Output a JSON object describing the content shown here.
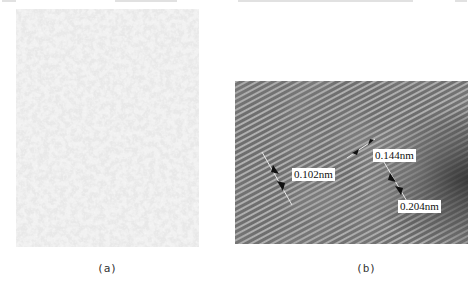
{
  "figure": {
    "panels": [
      {
        "id": "a",
        "caption": "(a)",
        "description": "Low-magnification micrograph with mottled gray/white texture"
      },
      {
        "id": "b",
        "caption": "(b)",
        "description": "High-resolution lattice fringe image with diagonal stripes",
        "annotations": [
          {
            "label": "0.102nm"
          },
          {
            "label": "0.144nm"
          },
          {
            "label": "0.204nm"
          }
        ]
      }
    ],
    "colors": {
      "panel_a_base": "#bdbdbd",
      "panel_a_light": "#f2f2f2",
      "panel_b_base": "#7a7a7a",
      "fringe_light": "#b8b8b8",
      "fringe_dark": "#555555",
      "arrow": "#111111",
      "label_bg": "#ffffff"
    }
  }
}
